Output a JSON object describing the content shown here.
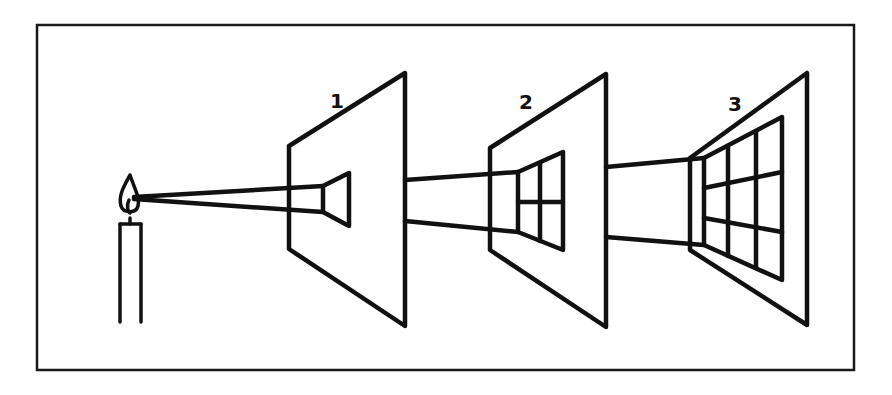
{
  "diagram": {
    "colors": {
      "line": "#111111",
      "background": "#ffffff"
    },
    "frame": {
      "x": 36,
      "y": 24,
      "width": 819,
      "height": 347
    },
    "light_source": {
      "type": "candle",
      "flame_tip": [
        128,
        198
      ]
    },
    "panels": [
      {
        "label": "1",
        "label_pos": [
          330,
          108
        ],
        "grid_cells": 1
      },
      {
        "label": "2",
        "label_pos": [
          519,
          109
        ],
        "grid_cells": 4
      },
      {
        "label": "3",
        "label_pos": [
          728,
          111
        ],
        "grid_cells": 9
      }
    ]
  }
}
